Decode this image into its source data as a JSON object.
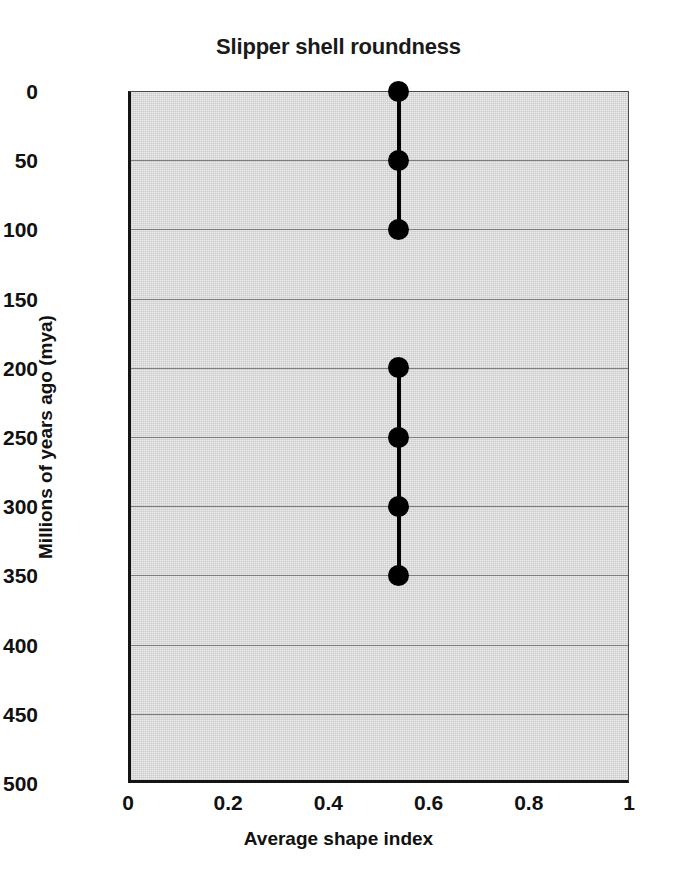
{
  "chart_data": {
    "type": "scatter",
    "title": "Slipper shell roundness",
    "xlabel": "Average shape index",
    "ylabel": "Millions of years ago (mya)",
    "xlim": [
      0,
      1
    ],
    "ylim": [
      0,
      500
    ],
    "y_axis_inverted": true,
    "grid": "horizontal",
    "legend": "none",
    "xticks": [
      0,
      0.2,
      0.4,
      0.6,
      0.8,
      1
    ],
    "xtick_labels": [
      "0",
      "0.2",
      "0.4",
      "0.6",
      "0.8",
      "1"
    ],
    "yticks": [
      0,
      50,
      100,
      150,
      200,
      250,
      300,
      350,
      400,
      450,
      500
    ],
    "ytick_labels": [
      "0",
      "50",
      "100",
      "150",
      "200",
      "250",
      "300",
      "350",
      "400",
      "450",
      "500"
    ],
    "marker_style": "filled-circle",
    "marker_color": "#000000",
    "line_color": "#000000",
    "plot_background": "#cccccc",
    "gridline_color": "#7d7d7d",
    "series": [
      {
        "name": "recent segment",
        "x": [
          0.54,
          0.54,
          0.54
        ],
        "y": [
          0,
          50,
          100
        ],
        "connected": true
      },
      {
        "name": "older segment",
        "x": [
          0.54,
          0.54,
          0.54,
          0.54
        ],
        "y": [
          200,
          250,
          300,
          350
        ],
        "connected": true
      }
    ],
    "points": [
      {
        "x": 0.54,
        "y": 0
      },
      {
        "x": 0.54,
        "y": 50
      },
      {
        "x": 0.54,
        "y": 100
      },
      {
        "x": 0.54,
        "y": 200
      },
      {
        "x": 0.54,
        "y": 250
      },
      {
        "x": 0.54,
        "y": 300
      },
      {
        "x": 0.54,
        "y": 350
      }
    ]
  }
}
